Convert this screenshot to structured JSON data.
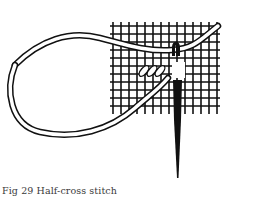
{
  "figure": {
    "caption": "Fig 29 Half-cross stitch",
    "illustration": "half-cross-stitch-diagram",
    "colors": {
      "ink": "#111111",
      "paper": "#ffffff",
      "caption_text": "#3a3a3a"
    }
  }
}
